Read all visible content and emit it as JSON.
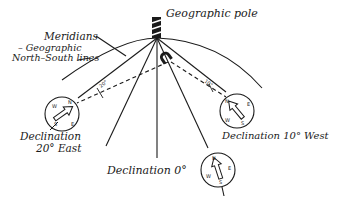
{
  "labels": {
    "pole": "Geographic pole",
    "meridians_title": "Meridians",
    "meridians_sub1": "– Geographic",
    "meridians_sub2": "North–South lines",
    "declination_east_line1": "Declination",
    "declination_east_line2": "20° East",
    "declination_west": "Declination 10° West",
    "declination_zero": "Declination 0°",
    "angle_east": "20°",
    "angle_west": "10°"
  },
  "compass_letters": {
    "n": "N",
    "e": "E",
    "s": "S",
    "w": "W"
  },
  "colors": {
    "ink": "#1a1a1a",
    "background": "#ffffff"
  }
}
